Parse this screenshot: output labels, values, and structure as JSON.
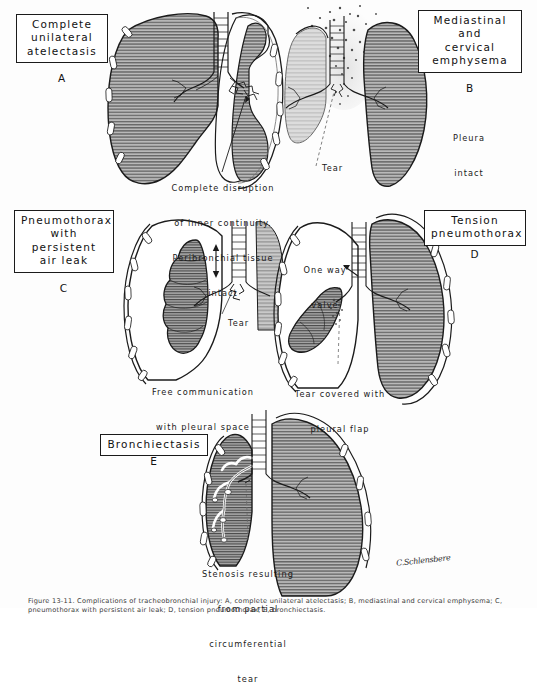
{
  "figure": {
    "title_caption": "Figure 13-11. Complications of tracheobronchial injury: A, complete unilateral atelectasis; B, mediastinal and cervical emphysema; C, pneumothorax with persistent air leak; D, tension pneumothorax; E, bronchiectasis.",
    "signature": "C.Schlensbere",
    "ink_color": "#1b1b1b",
    "lung_fill": "#9a9a9a",
    "background": "#fdfdfd"
  },
  "panels": [
    {
      "id": "A",
      "letter": "A",
      "title_lines": [
        "Complete",
        "unilateral",
        "atelectasis"
      ],
      "annotations": [
        {
          "name": "disruption-note",
          "lines": [
            "Complete disruption",
            "of inner continuity.",
            "Peribronchial tissue",
            "intact"
          ]
        }
      ]
    },
    {
      "id": "B",
      "letter": "B",
      "title_lines": [
        "Mediastinal",
        "and",
        "cervical",
        "emphysema"
      ],
      "annotations": [
        {
          "name": "pleura-note",
          "lines": [
            "Pleura",
            "intact"
          ]
        },
        {
          "name": "tear-label",
          "lines": [
            "Tear"
          ]
        }
      ]
    },
    {
      "id": "C",
      "letter": "C",
      "title_lines": [
        "Pneumothorax",
        "with",
        "persistent",
        "air leak"
      ],
      "annotations": [
        {
          "name": "tear-label",
          "lines": [
            "Tear"
          ]
        },
        {
          "name": "free-communication-note",
          "lines": [
            "Free communication",
            "with pleural space"
          ]
        }
      ]
    },
    {
      "id": "D",
      "letter": "D",
      "title_lines": [
        "Tension",
        "pneumothorax"
      ],
      "annotations": [
        {
          "name": "one-way-valve-label",
          "lines": [
            "One way",
            "valve"
          ]
        },
        {
          "name": "pleural-flap-note",
          "lines": [
            "Tear covered with",
            "pleural flap"
          ]
        }
      ]
    },
    {
      "id": "E",
      "letter": "E",
      "title_lines": [
        "Bronchiectasis"
      ],
      "annotations": [
        {
          "name": "stenosis-note",
          "lines": [
            "Stenosis resulting",
            "from partial",
            "circumferential",
            "tear"
          ]
        }
      ]
    }
  ]
}
